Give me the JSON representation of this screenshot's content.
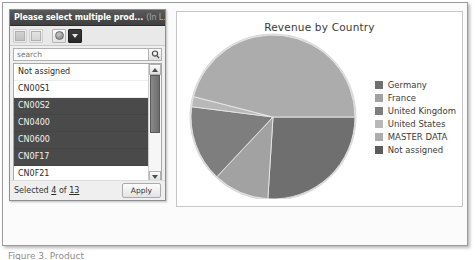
{
  "dialog": {
    "title_main": "Please select multiple prod...",
    "title_sub": "(In L...",
    "toolbar": [
      {
        "name": "select-all-button",
        "glyph": "grid-icon",
        "state": "disabled"
      },
      {
        "name": "deselect-all-button",
        "glyph": "grid-light-icon",
        "state": "disabled"
      },
      {
        "name": "filter-toggle-button",
        "glyph": "sphere-icon",
        "state": "normal"
      },
      {
        "name": "dropdown-toggle-button",
        "glyph": "caret-down-icon",
        "state": "pressed"
      }
    ],
    "search": {
      "placeholder": "search",
      "value": "",
      "button_icon": "magnifier-icon"
    },
    "list": {
      "items": [
        {
          "label": "Not assigned",
          "selected": false
        },
        {
          "label": "CN00S1",
          "selected": false
        },
        {
          "label": "CN00S2",
          "selected": true
        },
        {
          "label": "CN0400",
          "selected": true
        },
        {
          "label": "CN0600",
          "selected": true
        },
        {
          "label": "CN0F17",
          "selected": true
        },
        {
          "label": "CN0F21",
          "selected": false
        },
        {
          "label": "HT1000",
          "selected": false
        }
      ],
      "scroll_thumb_percent": 58
    },
    "footer": {
      "status_prefix": "Selected",
      "selected_count": "4",
      "status_middle": "of",
      "total_count": "13",
      "apply_label": "Apply"
    }
  },
  "chart_data": {
    "type": "pie",
    "title": "Revenue by Country",
    "categories": [
      "Germany",
      "France",
      "United Kingdom",
      "United States",
      "MASTER DATA",
      "Not assigned"
    ],
    "values": [
      26,
      11,
      15,
      2,
      46,
      0
    ],
    "colors": [
      "#6f6f6f",
      "#a2a2a2",
      "#7e7e7e",
      "#b8b8b8",
      "#acacac",
      "#5c5c5c"
    ],
    "start_angle_deg": 0,
    "direction": "clockwise",
    "legend_position": "right",
    "grid": false,
    "xlabel": "",
    "ylabel": ""
  },
  "caption": {
    "text": "Figure 3. Product"
  }
}
